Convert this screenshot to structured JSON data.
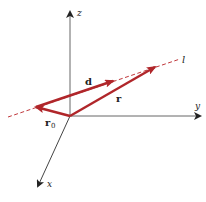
{
  "diagram": {
    "axes": {
      "x": {
        "label": "x"
      },
      "y": {
        "label": "y"
      },
      "z": {
        "label": "z"
      }
    },
    "line": {
      "label": "l"
    },
    "vectors": {
      "r0": {
        "label": "r",
        "subscript": "0"
      },
      "d": {
        "label": "d"
      },
      "r": {
        "label": "r"
      }
    },
    "colors": {
      "axis": "#333333",
      "vector": "#b0262a",
      "line": "#c0383c"
    }
  }
}
